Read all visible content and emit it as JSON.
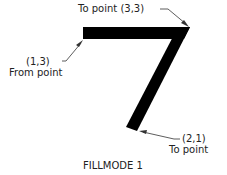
{
  "diagram": {
    "caption": "FILLMODE 1",
    "shape_color": "#000000",
    "labels": {
      "to_point_top": "To point (3,3)",
      "from_coord": "(1,3)",
      "from_text": "From point",
      "to_bottom_coord": "(2,1)",
      "to_bottom_text": "To point"
    },
    "points": [
      {
        "name": "From point",
        "coord": "(1,3)"
      },
      {
        "name": "To point",
        "coord": "(3,3)"
      },
      {
        "name": "To point",
        "coord": "(2,1)"
      }
    ]
  }
}
